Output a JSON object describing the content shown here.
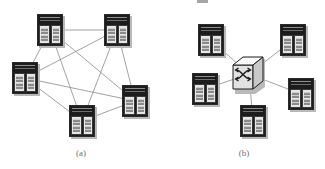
{
  "figure": {
    "width": 325,
    "height": 169,
    "background": "#ffffff",
    "line_color": "#8a8a8a",
    "node_dark": "#1c1c1c",
    "node_light": "#e6e6e6",
    "shadow_color": "#b9b9b9",
    "caption_color": "#6f6f6f"
  },
  "panels": [
    {
      "id": "a",
      "caption": "(a)",
      "topology": "full-mesh",
      "caption_x": 84,
      "caption_y": 148,
      "nodes": [
        {
          "id": "a1",
          "name": "server-rack-top-left",
          "x": 37,
          "y": 14,
          "cx": 50,
          "cy": 30
        },
        {
          "id": "a2",
          "name": "server-rack-top-right",
          "x": 104,
          "y": 14,
          "cx": 117,
          "cy": 30
        },
        {
          "id": "a3",
          "name": "server-rack-left",
          "x": 12,
          "y": 62,
          "cx": 25,
          "cy": 78
        },
        {
          "id": "a4",
          "name": "server-rack-right",
          "x": 122,
          "y": 85,
          "cx": 135,
          "cy": 101
        },
        {
          "id": "a5",
          "name": "server-rack-bottom-center",
          "x": 69,
          "y": 105,
          "cx": 82,
          "cy": 121
        }
      ],
      "edges": [
        [
          "a1",
          "a2"
        ],
        [
          "a1",
          "a3"
        ],
        [
          "a1",
          "a4"
        ],
        [
          "a1",
          "a5"
        ],
        [
          "a2",
          "a3"
        ],
        [
          "a2",
          "a4"
        ],
        [
          "a2",
          "a5"
        ],
        [
          "a3",
          "a4"
        ],
        [
          "a3",
          "a5"
        ],
        [
          "a4",
          "a5"
        ]
      ]
    },
    {
      "id": "b",
      "caption": "(b)",
      "topology": "star-via-switch",
      "caption_x": 84,
      "caption_y": 148,
      "switch": {
        "id": "bs",
        "name": "network-switch",
        "x": 68,
        "y": 54,
        "cx": 86,
        "cy": 74,
        "icon": "switch-crossing-arrows-icon"
      },
      "nodes": [
        {
          "id": "b1",
          "name": "server-rack-top-left",
          "x": 35,
          "y": 24,
          "cx": 48,
          "cy": 40
        },
        {
          "id": "b2",
          "name": "server-rack-top-right",
          "x": 117,
          "y": 24,
          "cx": 130,
          "cy": 40
        },
        {
          "id": "b3",
          "name": "server-rack-left",
          "x": 29,
          "y": 73,
          "cx": 42,
          "cy": 89
        },
        {
          "id": "b4",
          "name": "server-rack-right",
          "x": 125,
          "y": 78,
          "cx": 138,
          "cy": 94
        },
        {
          "id": "b5",
          "name": "server-rack-bottom-center",
          "x": 77,
          "y": 105,
          "cx": 90,
          "cy": 121
        }
      ],
      "edges": [
        [
          "bs",
          "b1"
        ],
        [
          "bs",
          "b2"
        ],
        [
          "bs",
          "b3"
        ],
        [
          "bs",
          "b4"
        ],
        [
          "bs",
          "b5"
        ]
      ]
    }
  ],
  "artifact": {
    "name": "cropped-text-fragment",
    "x": 197,
    "y": 0,
    "w": 11,
    "h": 3
  }
}
